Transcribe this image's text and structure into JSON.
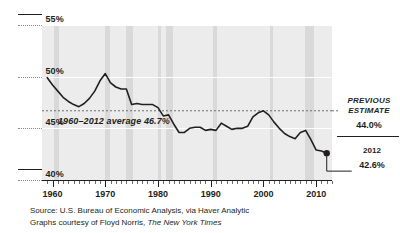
{
  "chart_data": {
    "type": "line",
    "title": "",
    "subtitle": "",
    "xlabel": "",
    "ylabel": "",
    "xlim": [
      1958,
      2013
    ],
    "ylim": [
      40,
      55
    ],
    "grid": false,
    "legend_position": "none",
    "y_ticks": [
      "55%",
      "50%",
      "45%",
      "40%"
    ],
    "y_tick_values": [
      55,
      50,
      45,
      40
    ],
    "x_ticks": [
      "1960",
      "1970",
      "1980",
      "1990",
      "2000",
      "2010"
    ],
    "x_tick_values": [
      1960,
      1970,
      1980,
      1990,
      2000,
      2010
    ],
    "series": [
      {
        "name": "Labor share of national income",
        "color": "#231f20",
        "x": [
          1959,
          1960,
          1961,
          1962,
          1963,
          1964,
          1965,
          1966,
          1967,
          1968,
          1969,
          1970,
          1971,
          1972,
          1973,
          1974,
          1975,
          1976,
          1977,
          1978,
          1979,
          1980,
          1981,
          1982,
          1983,
          1984,
          1985,
          1986,
          1987,
          1988,
          1989,
          1990,
          1991,
          1992,
          1993,
          1994,
          1995,
          1996,
          1997,
          1998,
          1999,
          2000,
          2001,
          2002,
          2003,
          2004,
          2005,
          2006,
          2007,
          2008,
          2009,
          2010,
          2011,
          2012
        ],
        "values": [
          49.9,
          49.2,
          48.6,
          48.0,
          47.6,
          47.3,
          47.1,
          47.4,
          47.9,
          48.6,
          49.6,
          50.3,
          49.4,
          49.0,
          48.8,
          48.8,
          47.3,
          47.4,
          47.3,
          47.3,
          47.3,
          47.0,
          46.2,
          46.3,
          45.4,
          44.6,
          44.6,
          45.0,
          45.1,
          45.1,
          44.8,
          44.9,
          44.8,
          45.5,
          45.2,
          44.9,
          45.0,
          45.0,
          45.2,
          46.1,
          46.5,
          46.7,
          46.3,
          45.6,
          45.0,
          44.5,
          44.2,
          44.0,
          44.6,
          44.8,
          43.9,
          42.9,
          42.8,
          42.6
        ]
      }
    ],
    "reference_lines": [
      {
        "name": "1960-2012 average",
        "value": 46.7,
        "style": "dashed",
        "label": "1960–2012 average 46.7%"
      }
    ],
    "shaded_bands": {
      "name": "recessions",
      "color": "#d9d9d9",
      "ranges": [
        [
          1960.3,
          1961.2
        ],
        [
          1969.9,
          1970.9
        ],
        [
          1973.9,
          1975.2
        ],
        [
          1980.0,
          1980.6
        ],
        [
          1981.5,
          1982.9
        ],
        [
          1990.5,
          1991.2
        ],
        [
          2001.2,
          2001.9
        ],
        [
          2007.9,
          2009.5
        ]
      ]
    },
    "endpoint_marker": {
      "x": 2012,
      "value": 42.6,
      "shape": "circle",
      "color": "#231f20"
    },
    "annotations": [
      {
        "name": "previous-estimate",
        "title": "PREVIOUS ESTIMATE",
        "value": "44.0%"
      },
      {
        "name": "current-2012",
        "title": "2012",
        "value": "42.6%"
      }
    ]
  },
  "axes": {
    "y_labels": [
      {
        "text": "55%",
        "value": 55
      },
      {
        "text": "50%",
        "value": 50
      },
      {
        "text": "45%",
        "value": 45
      },
      {
        "text": "40%",
        "value": 40
      }
    ],
    "x_labels": [
      {
        "text": "1960",
        "value": 1960
      },
      {
        "text": "1970",
        "value": 1970
      },
      {
        "text": "1980",
        "value": 1980
      },
      {
        "text": "1990",
        "value": 1990
      },
      {
        "text": "2000",
        "value": 2000
      },
      {
        "text": "2010",
        "value": 2010
      }
    ]
  },
  "average_annotation": {
    "label": "1960–2012 average 46.7%"
  },
  "callouts": {
    "previous_estimate": {
      "line1": "PREVIOUS",
      "line2": "ESTIMATE",
      "value": "44.0%"
    },
    "current": {
      "year": "2012",
      "value": "42.6%"
    }
  },
  "footer": {
    "line1": "Source: U.S. Bureau of Economic Analysis, via Haver Analytic",
    "line2_prefix": "Graphs courtesy of Floyd Norris, ",
    "line2_italic": "The New York Times"
  },
  "colors": {
    "plot_background": "#ececec",
    "band": "#d9d9d9",
    "line": "#231f20",
    "gridline": "#ffffff",
    "text": "#231f20"
  }
}
